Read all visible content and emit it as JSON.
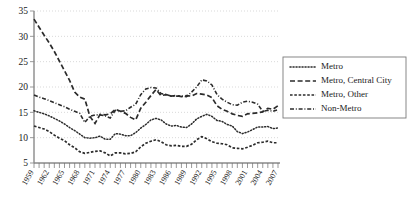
{
  "chart_data": {
    "type": "line",
    "title": "",
    "xlabel": "",
    "ylabel": "",
    "ylim": [
      5,
      35
    ],
    "xlim": [
      1959,
      2007
    ],
    "grid": true,
    "legend_position": "right",
    "ytick_labels": [
      "5",
      "10",
      "15",
      "20",
      "25",
      "30",
      "35"
    ],
    "ytick_values": [
      5,
      10,
      15,
      20,
      25,
      30,
      35
    ],
    "xtick_labels": [
      "1959",
      "1962",
      "1965",
      "1968",
      "1971",
      "1974",
      "1977",
      "1980",
      "1983",
      "1986",
      "1989",
      "1992",
      "1995",
      "1998",
      "2001",
      "2004",
      "2007"
    ],
    "xtick_values": [
      1959,
      1962,
      1965,
      1968,
      1971,
      1974,
      1977,
      1980,
      1983,
      1986,
      1989,
      1992,
      1995,
      1998,
      2001,
      2004,
      2007
    ],
    "x": [
      1959,
      1960,
      1961,
      1962,
      1963,
      1964,
      1965,
      1966,
      1967,
      1968,
      1969,
      1970,
      1971,
      1972,
      1973,
      1974,
      1975,
      1976,
      1977,
      1978,
      1979,
      1980,
      1981,
      1982,
      1983,
      1984,
      1985,
      1986,
      1987,
      1988,
      1989,
      1990,
      1991,
      1992,
      1993,
      1994,
      1995,
      1996,
      1997,
      1998,
      1999,
      2000,
      2001,
      2002,
      2003,
      2004,
      2005,
      2006,
      2007
    ],
    "series": [
      {
        "name": "Metro",
        "dash": "dotted",
        "values": [
          15.3,
          15.0,
          14.7,
          14.3,
          13.8,
          13.3,
          12.7,
          12.0,
          11.4,
          10.7,
          10.0,
          9.9,
          10.0,
          10.3,
          9.7,
          9.7,
          10.8,
          10.7,
          10.4,
          10.4,
          11.0,
          11.9,
          12.6,
          13.5,
          13.8,
          13.5,
          12.7,
          12.3,
          12.4,
          12.1,
          12.0,
          12.7,
          13.7,
          14.2,
          14.6,
          14.2,
          13.4,
          13.2,
          12.6,
          12.3,
          11.2,
          10.8,
          11.1,
          11.6,
          12.1,
          12.1,
          12.2,
          11.8,
          11.9
        ]
      },
      {
        "name": "Metro, Central City",
        "dash": "long-dash",
        "values": [
          33.4,
          31.8,
          30.2,
          28.7,
          27.0,
          25.1,
          23.2,
          21.3,
          19.0,
          18.0,
          17.6,
          14.2,
          12.8,
          14.6,
          14.5,
          14.7,
          15.6,
          15.2,
          14.8,
          14.0,
          13.5,
          15.8,
          17.0,
          18.3,
          19.5,
          18.3,
          18.5,
          18.2,
          18.3,
          18.1,
          18.3,
          18.2,
          18.7,
          18.6,
          18.4,
          17.9,
          16.3,
          15.6,
          15.2,
          14.7,
          14.4,
          14.2,
          14.7,
          14.8,
          14.9,
          15.1,
          15.8,
          15.6,
          16.3
        ]
      },
      {
        "name": "Metro, Other",
        "dash": "short-dash",
        "values": [
          12.3,
          12.0,
          11.7,
          11.2,
          10.5,
          9.9,
          9.4,
          8.6,
          8.0,
          7.2,
          6.9,
          7.1,
          7.3,
          7.4,
          7.0,
          6.4,
          7.0,
          7.0,
          6.8,
          6.9,
          7.2,
          8.2,
          8.9,
          9.3,
          9.6,
          9.2,
          8.6,
          8.4,
          8.5,
          8.3,
          8.3,
          8.7,
          9.6,
          10.2,
          9.8,
          9.2,
          8.9,
          8.8,
          8.6,
          8.0,
          7.9,
          7.8,
          8.1,
          8.5,
          9.0,
          9.1,
          9.3,
          9.0,
          9.0
        ]
      },
      {
        "name": "Non-Metro",
        "dash": "dash-dot",
        "values": [
          18.4,
          18.0,
          17.7,
          17.3,
          16.9,
          16.5,
          16.1,
          15.6,
          15.2,
          14.8,
          13.0,
          14.2,
          14.5,
          14.5,
          14.3,
          13.9,
          15.4,
          15.2,
          15.3,
          16.0,
          16.6,
          18.5,
          19.6,
          19.9,
          19.8,
          18.7,
          18.5,
          18.2,
          18.2,
          18.2,
          18.1,
          19.0,
          20.0,
          21.4,
          21.2,
          20.4,
          18.5,
          17.6,
          17.0,
          16.5,
          16.4,
          17.0,
          17.2,
          17.0,
          16.6,
          15.2,
          15.4,
          15.2,
          15.5
        ]
      }
    ]
  },
  "legend": {
    "items": [
      {
        "label": "Metro",
        "dash": "dotted"
      },
      {
        "label": "Metro, Central City",
        "dash": "long-dash"
      },
      {
        "label": "Metro, Other",
        "dash": "short-dash"
      },
      {
        "label": "Non-Metro",
        "dash": "dash-dot"
      }
    ]
  }
}
